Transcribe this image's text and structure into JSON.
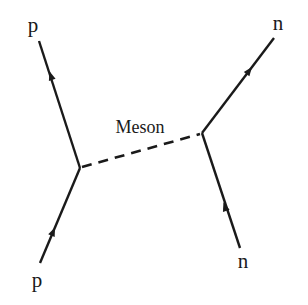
{
  "diagram": {
    "type": "feynman",
    "colors": {
      "line": "#1a1a1a",
      "background": "#ffffff"
    },
    "labels": {
      "incoming_left": "p",
      "outgoing_left": "p",
      "incoming_right": "n",
      "outgoing_right": "n",
      "exchange": "Meson"
    },
    "vertices": [
      {
        "id": "left-vertex",
        "x": 80,
        "y": 168
      },
      {
        "id": "right-vertex",
        "x": 202,
        "y": 133
      }
    ],
    "lines": [
      {
        "id": "proton-in",
        "from": [
          40,
          263
        ],
        "to": [
          80,
          168
        ],
        "style": "solid",
        "arrow": "forward"
      },
      {
        "id": "proton-out",
        "from": [
          80,
          168
        ],
        "to": [
          39,
          41
        ],
        "style": "solid",
        "arrow": "forward"
      },
      {
        "id": "neutron-in",
        "from": [
          240,
          248
        ],
        "to": [
          202,
          133
        ],
        "style": "solid",
        "arrow": "forward"
      },
      {
        "id": "neutron-out",
        "from": [
          202,
          133
        ],
        "to": [
          274,
          38
        ],
        "style": "solid",
        "arrow": "forward"
      },
      {
        "id": "meson-exchange",
        "from": [
          80,
          168
        ],
        "to": [
          202,
          133
        ],
        "style": "dashed",
        "arrow": "none"
      }
    ]
  }
}
